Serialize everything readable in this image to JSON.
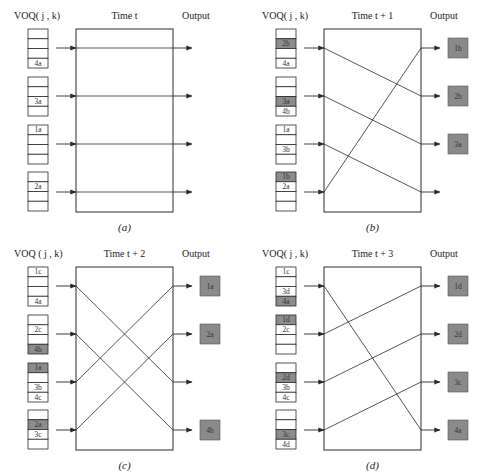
{
  "figure": {
    "colors": {
      "line": "#2a2a2a",
      "cell_fill": "#ffffff",
      "cell_highlight": "#8c8c8c",
      "output_fill": "#8a8a8a",
      "output_border": "#555555"
    },
    "panels": [
      {
        "id": "a",
        "origin": [
          0,
          0
        ],
        "voq_label": "VOQ( j , k)",
        "time_label": "Time t",
        "output_label": "Output",
        "caption": "(a)",
        "queues": [
          [
            {
              "label": ""
            },
            {
              "label": ""
            },
            {
              "label": ""
            },
            {
              "label": "4a",
              "highlight": false
            }
          ],
          [
            {
              "label": ""
            },
            {
              "label": ""
            },
            {
              "label": "3a",
              "highlight": false
            },
            {
              "label": ""
            }
          ],
          [
            {
              "label": "1a",
              "highlight": false
            },
            {
              "label": ""
            },
            {
              "label": ""
            },
            {
              "label": ""
            }
          ],
          [
            {
              "label": ""
            },
            {
              "label": "2a",
              "highlight": false
            },
            {
              "label": ""
            },
            {
              "label": ""
            }
          ]
        ],
        "connections": [
          [
            0,
            0
          ],
          [
            1,
            1
          ],
          [
            2,
            2
          ],
          [
            3,
            3
          ]
        ],
        "outputs": [
          "",
          "",
          "",
          ""
        ]
      },
      {
        "id": "b",
        "origin": [
          248,
          0
        ],
        "voq_label": "VOQ( j , k)",
        "time_label": "Time t + 1",
        "output_label": "Output",
        "caption": "(b)",
        "queues": [
          [
            {
              "label": ""
            },
            {
              "label": "2b",
              "highlight": true
            },
            {
              "label": ""
            },
            {
              "label": "4a",
              "highlight": false
            }
          ],
          [
            {
              "label": ""
            },
            {
              "label": ""
            },
            {
              "label": "3a",
              "highlight": true
            },
            {
              "label": "4b",
              "highlight": false
            }
          ],
          [
            {
              "label": "1a",
              "highlight": false
            },
            {
              "label": ""
            },
            {
              "label": "3b",
              "highlight": false
            },
            {
              "label": ""
            }
          ],
          [
            {
              "label": "1b",
              "highlight": true
            },
            {
              "label": "2a",
              "highlight": false
            },
            {
              "label": ""
            },
            {
              "label": ""
            }
          ]
        ],
        "connections": [
          [
            0,
            1
          ],
          [
            1,
            2
          ],
          [
            2,
            3
          ],
          [
            3,
            0
          ]
        ],
        "outputs": [
          "1b",
          "2b",
          "3a",
          ""
        ]
      },
      {
        "id": "c",
        "origin": [
          0,
          238
        ],
        "voq_label": "VOQ ( j , k)",
        "time_label": "Time t + 2",
        "output_label": "Output",
        "caption": "(c)",
        "queues": [
          [
            {
              "label": "1c",
              "highlight": false
            },
            {
              "label": ""
            },
            {
              "label": ""
            },
            {
              "label": "4a",
              "highlight": false
            }
          ],
          [
            {
              "label": ""
            },
            {
              "label": "2c",
              "highlight": false
            },
            {
              "label": ""
            },
            {
              "label": "4b",
              "highlight": true
            }
          ],
          [
            {
              "label": "1a",
              "highlight": true
            },
            {
              "label": ""
            },
            {
              "label": "3b",
              "highlight": false
            },
            {
              "label": "4c",
              "highlight": false
            }
          ],
          [
            {
              "label": ""
            },
            {
              "label": "2a",
              "highlight": true
            },
            {
              "label": "3c",
              "highlight": false
            },
            {
              "label": ""
            }
          ]
        ],
        "connections": [
          [
            0,
            2
          ],
          [
            1,
            3
          ],
          [
            2,
            0
          ],
          [
            3,
            1
          ]
        ],
        "outputs": [
          "1a",
          "2a",
          "",
          "4b"
        ]
      },
      {
        "id": "d",
        "origin": [
          248,
          238
        ],
        "voq_label": "VOQ( j , k)",
        "time_label": "Time t + 3",
        "output_label": "Output",
        "caption": "(d)",
        "queues": [
          [
            {
              "label": "1c",
              "highlight": false
            },
            {
              "label": ""
            },
            {
              "label": "3d",
              "highlight": false
            },
            {
              "label": "4a",
              "highlight": true
            }
          ],
          [
            {
              "label": "1d",
              "highlight": true
            },
            {
              "label": "2c",
              "highlight": false
            },
            {
              "label": ""
            },
            {
              "label": ""
            }
          ],
          [
            {
              "label": ""
            },
            {
              "label": "2d",
              "highlight": true
            },
            {
              "label": "3b",
              "highlight": false
            },
            {
              "label": "4c",
              "highlight": false
            }
          ],
          [
            {
              "label": ""
            },
            {
              "label": ""
            },
            {
              "label": "3c",
              "highlight": true
            },
            {
              "label": "4d",
              "highlight": false
            }
          ]
        ],
        "connections": [
          [
            0,
            3
          ],
          [
            1,
            0
          ],
          [
            2,
            1
          ],
          [
            3,
            2
          ]
        ],
        "outputs": [
          "1d",
          "2d",
          "3c",
          "4a"
        ]
      }
    ]
  }
}
